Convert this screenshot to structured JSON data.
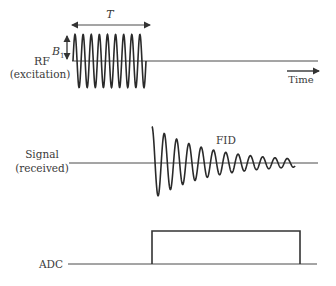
{
  "diagram": {
    "rf": {
      "label_line1": "RF",
      "label_line2": "(excitation)",
      "duration_label": "T",
      "amplitude_label": "B",
      "amplitude_subscript": "1",
      "cycles": 9
    },
    "time_axis": {
      "label": "Time"
    },
    "signal": {
      "label_line1": "Signal",
      "label_line2": "(received)",
      "waveform_label": "FID"
    },
    "adc": {
      "label": "ADC"
    },
    "colors": {
      "line": "#4a4a4a",
      "wave": "#2a2a2a",
      "text": "#3a3a3a",
      "background": "#ffffff"
    }
  }
}
